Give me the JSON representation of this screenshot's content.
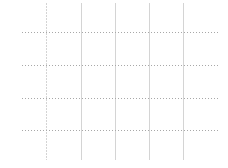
{
  "chart_data": {
    "type": "line",
    "title": "",
    "xlabel": "",
    "ylabel": "",
    "series": [],
    "x_tick_labels": [],
    "y_tick_labels": [],
    "grid": true,
    "legend": null,
    "layout": {
      "vertical_gridlines_x": [
        46,
        81,
        115,
        149,
        183
      ],
      "vertical_extent": [
        3,
        160
      ],
      "horizontal_gridlines_y": [
        32,
        65,
        98,
        130
      ],
      "horizontal_extent": [
        22,
        218
      ],
      "vertical_line_color": "#d4d4d4",
      "horizontal_line_color": "#a8a8a8",
      "background": "#ffffff"
    }
  }
}
